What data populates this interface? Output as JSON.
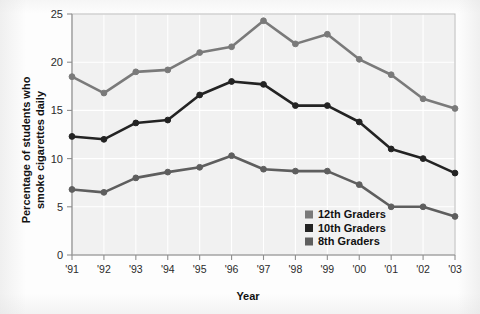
{
  "chart_data": {
    "type": "line",
    "title": "",
    "xlabel": "Year",
    "ylabel": "Percentage of students who smoke cigarettes daily",
    "ylabel_line1": "Percentage of students who",
    "ylabel_line2": "smoke cigarettes daily",
    "categories": [
      "'91",
      "'92",
      "'93",
      "'94",
      "'95",
      "'96",
      "'97",
      "'98",
      "'99",
      "'00",
      "'01",
      "'02",
      "'03"
    ],
    "x": [
      1991,
      1992,
      1993,
      1994,
      1995,
      1996,
      1997,
      1998,
      1999,
      2000,
      2001,
      2002,
      2003
    ],
    "ylim": [
      0,
      25
    ],
    "yticks": [
      0,
      5,
      10,
      15,
      20,
      25
    ],
    "ytick_labels": [
      "0",
      "5",
      "10",
      "15",
      "20",
      "25"
    ],
    "grid": true,
    "legend_position": "inside-lower-right",
    "series": [
      {
        "name": "12th Graders",
        "color": "#7a7a7a",
        "values": [
          18.5,
          16.8,
          19.0,
          19.2,
          21.0,
          21.6,
          24.3,
          21.9,
          22.9,
          20.3,
          18.7,
          16.2,
          15.2
        ]
      },
      {
        "name": "10th Graders",
        "color": "#232323",
        "values": [
          12.3,
          12.0,
          13.7,
          14.0,
          16.6,
          18.0,
          17.7,
          15.5,
          15.5,
          13.8,
          11.0,
          10.0,
          8.5
        ]
      },
      {
        "name": "8th Graders",
        "color": "#5e5e5e",
        "values": [
          6.8,
          6.5,
          8.0,
          8.6,
          9.1,
          10.3,
          8.9,
          8.7,
          8.7,
          7.3,
          5.0,
          5.0,
          4.0
        ]
      }
    ]
  },
  "legend": {
    "items": [
      {
        "label": "12th Graders",
        "swatch_color": "#7a7a7a"
      },
      {
        "label": "10th Graders",
        "swatch_color": "#232323"
      },
      {
        "label": "8th Graders",
        "swatch_color": "#5e5e5e"
      }
    ]
  },
  "style": {
    "plot_background": "#f1f1f1",
    "grid_color": "#ffffff",
    "frame_color": "#b9b9b9",
    "axis_text_color": "#2b2b2b"
  }
}
